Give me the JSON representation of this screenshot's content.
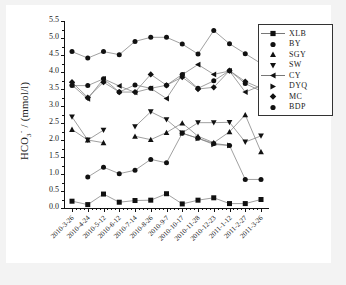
{
  "figure": {
    "background_color": "#f3f3f3",
    "paper_color": "#ffffff",
    "line_color": "#777777",
    "marker_color": "#111111"
  },
  "axis": {
    "ylabel_text": "HCO",
    "ylabel_sub": "3",
    "ylabel_sup": "-",
    "ylabel_unit": " / (mmol/l)",
    "ylabel_full": "HCO3- / (mmol/l)",
    "yticks": [
      "0.0",
      "0.5",
      "1.0",
      "1.5",
      "2.0",
      "2.5",
      "3.0",
      "3.5",
      "4.0",
      "4.5",
      "5.0",
      "5.5"
    ],
    "ymin": 0.0,
    "ymax": 5.5
  },
  "legend": {
    "position": "top-right",
    "items": [
      {
        "label": "XLB",
        "marker": "square",
        "has_line": true
      },
      {
        "label": "BY",
        "marker": "circle",
        "has_line": false
      },
      {
        "label": "SGY",
        "marker": "triangle-up",
        "has_line": false
      },
      {
        "label": "SW",
        "marker": "triangle-down",
        "has_line": false
      },
      {
        "label": "CY",
        "marker": "triangle-left",
        "has_line": true
      },
      {
        "label": "DYQ",
        "marker": "triangle-right",
        "has_line": false
      },
      {
        "label": "MC",
        "marker": "diamond",
        "has_line": false
      },
      {
        "label": "BDP",
        "marker": "circle",
        "has_line": false
      }
    ]
  },
  "chart_data": {
    "type": "line",
    "title": "",
    "xlabel": "",
    "ylabel": "HCO3- / (mmol/l)",
    "ylim": [
      0.0,
      5.5
    ],
    "grid": false,
    "legend_position": "top-right",
    "categories": [
      "2010-3-26",
      "2010-4-24",
      "2010-5-12",
      "2010-6-12",
      "2010-7-14",
      "2010-8-26",
      "2010-9-7",
      "2010-10-17",
      "2010-11-28",
      "2010-12-23",
      "2011-1-12",
      "2011-2-27",
      "2011-3-26"
    ],
    "series": [
      {
        "name": "XLB",
        "marker": "square",
        "values": [
          0.2,
          0.1,
          0.41,
          0.17,
          0.22,
          0.23,
          0.42,
          0.12,
          0.23,
          0.3,
          0.13,
          0.13,
          0.25
        ]
      },
      {
        "name": "BY",
        "marker": "circle",
        "values": [
          null,
          0.91,
          1.2,
          1.01,
          1.11,
          1.43,
          1.33,
          2.2,
          2.05,
          1.9,
          1.84,
          0.84,
          0.84
        ]
      },
      {
        "name": "SGY",
        "marker": "triangle-up",
        "values": [
          2.31,
          2.0,
          1.92,
          null,
          2.11,
          2.01,
          2.22,
          2.5,
          2.11,
          1.92,
          2.24,
          2.74,
          1.65
        ]
      },
      {
        "name": "SW",
        "marker": "triangle-down",
        "values": [
          2.68,
          2.0,
          2.29,
          null,
          2.39,
          2.83,
          2.6,
          2.21,
          2.51,
          2.51,
          2.52,
          1.94,
          2.12
        ]
      },
      {
        "name": "CY",
        "marker": "triangle-left",
        "values": [
          3.62,
          3.21,
          3.8,
          3.59,
          3.4,
          3.52,
          3.22,
          3.92,
          4.22,
          3.93,
          4.03,
          3.41,
          3.6
        ]
      },
      {
        "name": "DYQ",
        "marker": "triangle-right",
        "values": [
          null,
          null,
          null,
          null,
          null,
          null,
          null,
          2.2,
          2.05,
          1.87,
          1.84,
          null,
          null
        ]
      },
      {
        "name": "MC",
        "marker": "diamond",
        "values": [
          3.7,
          3.25,
          3.7,
          3.41,
          3.41,
          3.93,
          3.61,
          3.85,
          3.5,
          3.55,
          4.04,
          3.72,
          3.52
        ]
      },
      {
        "name": "BDP",
        "marker": "circle",
        "values": [
          4.6,
          4.41,
          4.6,
          4.51,
          4.9,
          5.02,
          5.02,
          4.82,
          4.53,
          5.22,
          4.83,
          4.54,
          4.25
        ]
      }
    ],
    "extra_series_note": "MC second band overlapping CY at 3.6-3.7 level",
    "overlap_series": [
      {
        "name": "MC-low",
        "marker": "circle",
        "values": [
          3.6,
          3.6,
          3.8,
          3.41,
          3.62,
          3.52,
          3.61,
          3.93,
          3.52,
          3.74,
          4.04,
          3.66,
          3.44
        ]
      }
    ]
  }
}
